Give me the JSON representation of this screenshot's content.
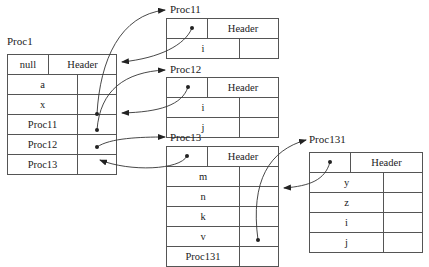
{
  "proc1": {
    "title": "Proc1",
    "header_left": "null",
    "header_right": "Header",
    "rows": [
      "a",
      "x",
      "Proc11",
      "Proc12",
      "Proc13"
    ]
  },
  "proc11": {
    "title": "Proc11",
    "header_right": "Header",
    "rows": [
      "i"
    ]
  },
  "proc12": {
    "title": "Proc12",
    "header_right": "Header",
    "rows": [
      "i",
      "j"
    ]
  },
  "proc13": {
    "title": "Proc13",
    "header_right": "Header",
    "rows": [
      "m",
      "n",
      "k",
      "v",
      "Proc131"
    ]
  },
  "proc131": {
    "title": "Proc131",
    "header_right": "Header",
    "rows": [
      "y",
      "z",
      "i",
      "j"
    ]
  }
}
